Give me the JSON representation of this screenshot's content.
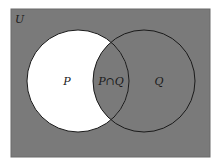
{
  "diagram": {
    "type": "venn",
    "universe_label": "U",
    "sets": [
      {
        "name": "P",
        "label": "P"
      },
      {
        "name": "Q",
        "label": "Q"
      }
    ],
    "intersection_label": "P∩Q",
    "shaded_region": "complement of (P minus Q)",
    "colors": {
      "shaded": "#7a7a7a",
      "unshaded": "#ffffff",
      "stroke": "#1a1a1a"
    }
  }
}
